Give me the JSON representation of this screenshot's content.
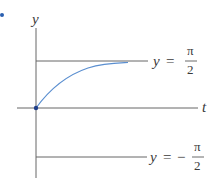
{
  "diagram": {
    "axes": {
      "vertical_label": "y",
      "horizontal_label": "t"
    },
    "asymptotes": [
      {
        "lhs": "y",
        "eq": "=",
        "sign": "",
        "num": "π",
        "den": "2"
      },
      {
        "lhs": "y",
        "eq": "=",
        "sign": "−",
        "num": "π",
        "den": "2"
      }
    ],
    "colors": {
      "curve": "#5b8fd0",
      "axis": "#555555",
      "point": "#1f3f8a",
      "bullet": "#2a5fb0"
    }
  }
}
